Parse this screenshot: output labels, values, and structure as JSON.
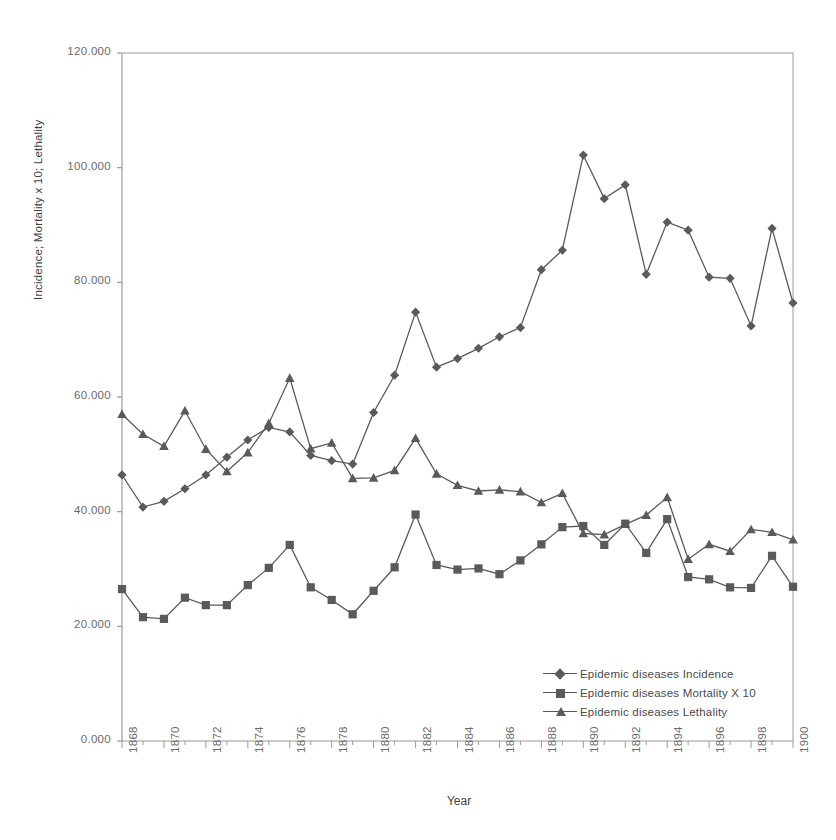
{
  "chart_data": {
    "type": "line",
    "title": "",
    "xlabel": "Year",
    "ylabel": "Incidence; Mortality x 10; Lethality",
    "xlim": [
      1868,
      1900
    ],
    "ylim": [
      0,
      120
    ],
    "grid": false,
    "legend_position": "bottom-right",
    "ytick_labels": [
      "0.000",
      "20.000",
      "40.000",
      "60.000",
      "80.000",
      "100.000",
      "120.000"
    ],
    "ytick_values": [
      0,
      20,
      40,
      60,
      80,
      100,
      120
    ],
    "xtick_labels": [
      "1868",
      "1870",
      "1872",
      "1874",
      "1876",
      "1878",
      "1880",
      "1882",
      "1884",
      "1886",
      "1888",
      "1890",
      "1892",
      "1894",
      "1896",
      "1898",
      "1900"
    ],
    "x": [
      1868,
      1869,
      1870,
      1871,
      1872,
      1873,
      1874,
      1875,
      1876,
      1877,
      1878,
      1879,
      1880,
      1881,
      1882,
      1883,
      1884,
      1885,
      1886,
      1887,
      1888,
      1889,
      1890,
      1891,
      1892,
      1893,
      1894,
      1895,
      1896,
      1897,
      1898,
      1899,
      1900
    ],
    "series": [
      {
        "name": "Epidemic diseases Incidence",
        "marker": "diamond",
        "color": "#5a5a5a",
        "values": [
          46.4,
          40.8,
          41.8,
          44.0,
          46.4,
          49.5,
          52.5,
          54.7,
          53.9,
          49.8,
          48.9,
          48.3,
          57.3,
          63.8,
          74.8,
          65.2,
          66.7,
          68.5,
          70.5,
          72.1,
          82.2,
          85.6,
          102.2,
          94.6,
          97.0,
          81.4,
          90.5,
          89.1,
          80.9,
          80.7,
          72.4,
          89.4,
          76.4
        ]
      },
      {
        "name": "Epidemic diseases Mortality X 10",
        "marker": "square",
        "color": "#5a5a5a",
        "values": [
          26.5,
          21.6,
          21.3,
          25.0,
          23.7,
          23.7,
          27.2,
          30.2,
          34.2,
          26.8,
          24.6,
          22.1,
          26.2,
          30.3,
          39.5,
          30.7,
          29.9,
          30.1,
          29.1,
          31.5,
          34.3,
          37.3,
          37.5,
          34.2,
          37.9,
          32.8,
          38.7,
          28.6,
          28.2,
          26.8,
          26.7,
          32.3,
          26.9
        ]
      },
      {
        "name": "Epidemic diseases Lethality",
        "marker": "triangle",
        "color": "#5a5a5a",
        "values": [
          57.0,
          53.5,
          51.4,
          57.6,
          50.9,
          47.0,
          50.3,
          55.4,
          63.3,
          51.0,
          52.0,
          45.8,
          45.9,
          47.2,
          52.8,
          46.6,
          44.6,
          43.6,
          43.8,
          43.5,
          41.6,
          43.2,
          36.2,
          36.0,
          37.8,
          39.4,
          42.5,
          31.7,
          34.3,
          33.1,
          36.9,
          36.4,
          35.1
        ]
      }
    ]
  },
  "legend": {
    "items": [
      {
        "label": "Epidemic diseases Incidence",
        "marker": "diamond"
      },
      {
        "label": "Epidemic diseases Mortality X 10",
        "marker": "square"
      },
      {
        "label": "Epidemic diseases Lethality",
        "marker": "triangle"
      }
    ]
  },
  "style": {
    "line_color": "#5a5a5a",
    "axis_color": "#9a9a9a",
    "text_color": "#6a6a6a"
  }
}
